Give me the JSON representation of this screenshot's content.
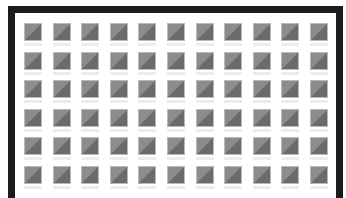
{
  "frame": {
    "border_color": "#1c1c1c",
    "background": "#ffffff"
  },
  "grid": {
    "rows": 6,
    "cols": 11,
    "tile_size": 18,
    "origin_x": 24,
    "origin_y": 23,
    "pitch_x": 28.6,
    "pitch_y": 28.6,
    "tile_light_color": "#8c8c8c",
    "tile_dark_color": "#6b6b6b",
    "tile_border_color": "#b9b9b9"
  }
}
